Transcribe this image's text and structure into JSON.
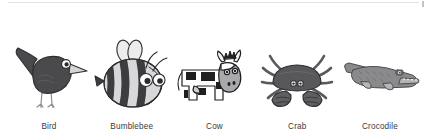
{
  "page": {
    "background_color": "#ffffff",
    "divider_color": "#e2e2e4",
    "caption_color": "#3a3a3c"
  },
  "gallery": {
    "items": [
      {
        "id": "bird",
        "label": "Bird",
        "icon_name": "bird-illustration",
        "colors": {
          "body": "#4a4a4c",
          "body_shadow": "#5c5c5e",
          "beak": "#d5d5d7",
          "eye_white": "#ffffff",
          "pupil": "#2a2a2c",
          "legs": "#8e8e90",
          "outline": "#2e2e30"
        }
      },
      {
        "id": "bumblebee",
        "label": "Bumblebee",
        "icon_name": "bumblebee-illustration",
        "colors": {
          "stripe_dark": "#3d3d3f",
          "stripe_light": "#d8d8da",
          "wing": "#ececed",
          "eye_white": "#ffffff",
          "pupil": "#2a2a2c",
          "outline": "#2e2e30"
        }
      },
      {
        "id": "cow",
        "label": "Cow",
        "icon_name": "cow-illustration",
        "colors": {
          "body": "#ffffff",
          "patches": "#1f1f21",
          "snout": "#a9a9ab",
          "horn": "#f2f2f2",
          "udder": "#cfcfd1",
          "outline": "#1f1f21"
        }
      },
      {
        "id": "crab",
        "label": "Crab",
        "icon_name": "crab-illustration",
        "colors": {
          "shell": "#58585a",
          "shell_shadow": "#6a6a6c",
          "claw": "#5f5f61",
          "legs": "#5a5a5c",
          "eye_white": "#ffffff",
          "pupil": "#2a2a2c",
          "outline": "#2e2e30"
        }
      },
      {
        "id": "crocodile",
        "label": "Crocodile",
        "icon_name": "crocodile-illustration",
        "colors": {
          "body": "#8a8a8c",
          "body_dark": "#6e6e70",
          "belly": "#b5b5b7",
          "teeth": "#ffffff",
          "eye_white": "#f0f0f0",
          "pupil": "#2a2a2c",
          "outline": "#4c4c4e"
        }
      }
    ]
  }
}
